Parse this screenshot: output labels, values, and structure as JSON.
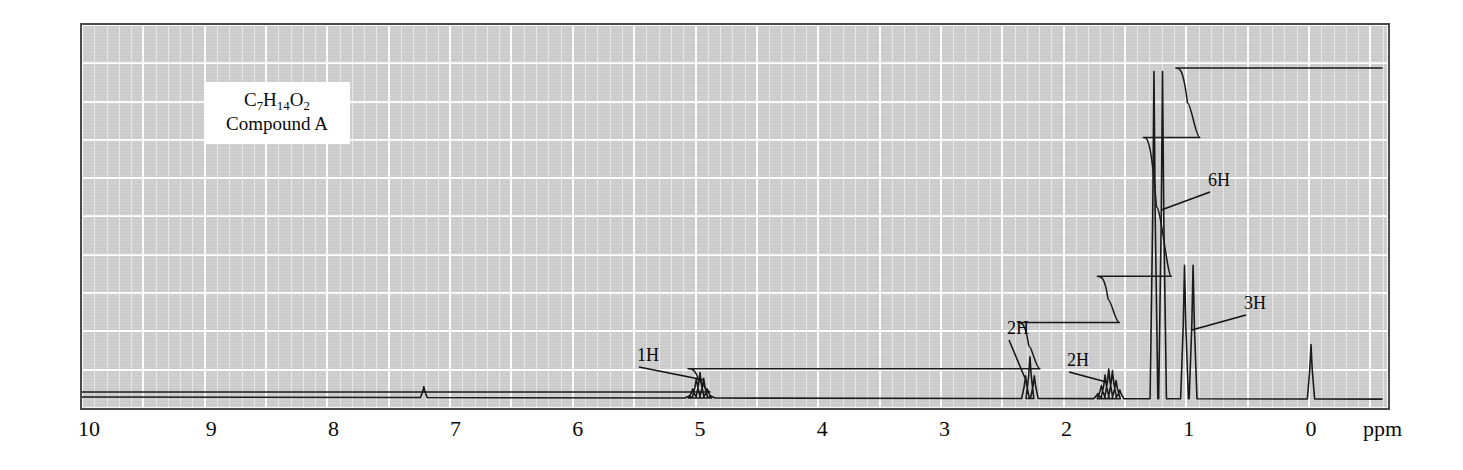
{
  "caption": {
    "formula_prefix": "C",
    "formula_parts": [
      {
        "element": "C",
        "count": "7"
      },
      {
        "element": "H",
        "count": "14"
      },
      {
        "element": "O",
        "count": "2"
      }
    ],
    "formula_text": "C7H14O2",
    "compound_label": "Compound A"
  },
  "axis": {
    "unit_label": "ppm",
    "tick_labels": [
      "10",
      "9",
      "8",
      "7",
      "6",
      "5",
      "4",
      "3",
      "2",
      "1",
      "0"
    ],
    "min_ppm": 0,
    "max_ppm": 10,
    "direction": "decreasing-left-to-right"
  },
  "annotations": [
    {
      "label": "1H",
      "ppm": 5.0
    },
    {
      "label": "2H",
      "ppm": 2.3
    },
    {
      "label": "2H",
      "ppm": 1.65
    },
    {
      "label": "6H",
      "ppm": 1.25
    },
    {
      "label": "3H",
      "ppm": 1.0
    }
  ],
  "colors": {
    "plot_background": "#cfcfcf",
    "gridline": "#ffffff",
    "trace": "#1a1a1a",
    "frame": "#4a4a4a",
    "caption_background": "#ffffff"
  },
  "chart_data": {
    "type": "line",
    "title": "",
    "subtitle": "",
    "xlabel": "ppm",
    "ylabel": "",
    "xlim": [
      10,
      0
    ],
    "ylim": [
      0,
      1
    ],
    "grid": true,
    "legend": null,
    "series": [
      {
        "name": "1H NMR spectrum",
        "peaks": [
          {
            "ppm": 7.26,
            "height": 0.035,
            "multiplicity": "s",
            "assignment": "residual CHCl3",
            "integration": null
          },
          {
            "ppm": 5.0,
            "height": 0.075,
            "multiplicity": "septet",
            "assignment": "OCH(CH3)2",
            "integration": "1H"
          },
          {
            "ppm": 2.3,
            "height": 0.12,
            "multiplicity": "t",
            "assignment": "CH2C=O",
            "integration": "2H"
          },
          {
            "ppm": 1.65,
            "height": 0.085,
            "multiplicity": "m",
            "assignment": "CH2",
            "integration": "2H"
          },
          {
            "ppm": 1.25,
            "height": 0.93,
            "multiplicity": "d",
            "assignment": "CH(CH3)2",
            "integration": "6H"
          },
          {
            "ppm": 1.0,
            "height": 0.38,
            "multiplicity": "d",
            "assignment": "CH3",
            "integration": "3H"
          },
          {
            "ppm": 0.0,
            "height": 0.155,
            "multiplicity": "s",
            "assignment": "TMS",
            "integration": null
          }
        ]
      },
      {
        "name": "integration trace",
        "steps": [
          {
            "ppm": 5.0,
            "rise": "1H"
          },
          {
            "ppm": 2.3,
            "rise": "2H"
          },
          {
            "ppm": 1.65,
            "rise": "2H"
          },
          {
            "ppm": 1.25,
            "rise": "6H"
          },
          {
            "ppm": 1.0,
            "rise": "3H"
          }
        ]
      }
    ]
  }
}
